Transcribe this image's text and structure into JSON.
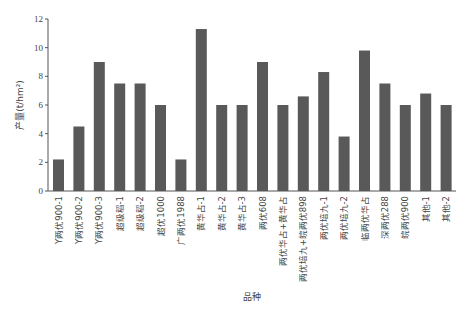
{
  "chart_data": {
    "type": "bar",
    "title": "",
    "xlabel": "品种",
    "ylabel": "产量(t/hm²)",
    "ylim": [
      0,
      12
    ],
    "yticks": [
      0,
      2,
      4,
      6,
      8,
      10,
      12
    ],
    "grid": false,
    "legend": null,
    "bar_color": "#595959",
    "categories": [
      "Y两优900-1",
      "Y两优900-2",
      "Y两优900-3",
      "超级稻-1",
      "超级稻-2",
      "超优1000",
      "广两优1988",
      "黄华占-1",
      "黄华占-2",
      "黄华占-3",
      "两优608",
      "两优华占+黄华占",
      "两优培九+皖两优898",
      "两优培九-1",
      "两优培九-2",
      "临两优华占",
      "深两优288",
      "皖两优900",
      "其他-1",
      "其他-2"
    ],
    "values": [
      2.2,
      4.5,
      9.0,
      7.5,
      7.5,
      6.0,
      2.2,
      11.3,
      6.0,
      6.0,
      9.0,
      6.0,
      6.6,
      8.3,
      3.8,
      9.8,
      7.5,
      6.0,
      6.8,
      6.0
    ]
  }
}
